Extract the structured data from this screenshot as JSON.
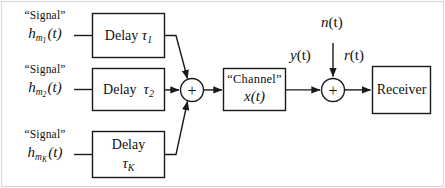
{
  "diagram": {
    "stroke_color": "#1a1a1a",
    "background_color": "#ffffff",
    "frame_color": "#cfcfcf",
    "inputs": [
      {
        "id": "input-1",
        "quoted": "“Signal”",
        "symbol_base": "h",
        "symbol_sub": "m",
        "symbol_subsub": "1",
        "symbol_arg": "(t)"
      },
      {
        "id": "input-2",
        "quoted": "“Signal”",
        "symbol_base": "h",
        "symbol_sub": "m",
        "symbol_subsub": "2",
        "symbol_arg": "(t)"
      },
      {
        "id": "input-3",
        "quoted": "“Signal”",
        "symbol_base": "h",
        "symbol_sub": "m",
        "symbol_subsub": "K",
        "symbol_arg": "(t)"
      }
    ],
    "delay_blocks": [
      {
        "id": "delay-1",
        "word": "Delay",
        "greek": "τ",
        "sub": "1",
        "two_line": false
      },
      {
        "id": "delay-2",
        "word": "Delay",
        "greek": "τ",
        "sub": "2",
        "two_line": false
      },
      {
        "id": "delay-3",
        "word": "Delay",
        "greek": "τ",
        "sub": "K",
        "two_line": true
      }
    ],
    "summers": [
      {
        "id": "summer-1",
        "glyph": "+"
      },
      {
        "id": "summer-2",
        "glyph": "+"
      }
    ],
    "channel_block": {
      "id": "channel",
      "quoted": "“Channel”",
      "symbol_base": "x",
      "symbol_arg": "(t)"
    },
    "receiver_block": {
      "id": "receiver",
      "label": "Receiver"
    },
    "signal_labels": [
      {
        "id": "noise",
        "base": "n",
        "arg": "(t)"
      },
      {
        "id": "channel-out",
        "base": "y",
        "arg": "(t)"
      },
      {
        "id": "received",
        "base": "r",
        "arg": "(t)"
      }
    ]
  }
}
